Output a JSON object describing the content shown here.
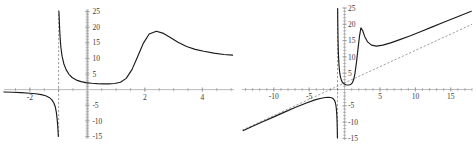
{
  "figure": {
    "panel_count": 2,
    "curve_color": "#1b1b1b",
    "axis_color": "#8d8d8d",
    "asymptote_color": "#5a5a5a",
    "background": "#ffffff"
  },
  "chart_data": [
    {
      "type": "line",
      "title": "",
      "xlabel": "",
      "ylabel": "",
      "grid": false,
      "legend": null,
      "xlim": [
        -2.9,
        5.1
      ],
      "ylim": [
        -15.5,
        25.5
      ],
      "xticks": [
        -2,
        2,
        4
      ],
      "xtick_labels": [
        "-2",
        "2",
        "4"
      ],
      "yticks": [
        -15,
        -10,
        -5,
        5,
        10,
        15,
        20,
        25
      ],
      "ytick_labels": [
        "-15",
        "-10",
        "-5",
        "5",
        "10",
        "15",
        "20",
        "25"
      ],
      "annotations": [
        "vertical asymptote at x = -1 (dashed)"
      ],
      "series": [
        {
          "name": "branch-left",
          "comment": "left branch: flat near y=-1, plunges to -infinity at x=-1",
          "x": [
            -2.9,
            -2.6,
            -2.3,
            -2.0,
            -1.8,
            -1.6,
            -1.45,
            -1.33,
            -1.24,
            -1.17,
            -1.12,
            -1.08,
            -1.05,
            -1.03,
            -1.018,
            -1.01
          ],
          "y": [
            -0.75,
            -0.85,
            -0.98,
            -1.15,
            -1.33,
            -1.62,
            -1.98,
            -2.5,
            -3.2,
            -4.2,
            -5.4,
            -7.2,
            -9.6,
            -11.8,
            -13.6,
            -15.0
          ]
        },
        {
          "name": "branch-right",
          "comment": "right branch: from +infinity at x=-1 down to a shallow valley, rises to peak 18.7 at x=2.4, decays to ~11",
          "x": [
            -0.99,
            -0.98,
            -0.965,
            -0.945,
            -0.92,
            -0.88,
            -0.82,
            -0.74,
            -0.64,
            -0.52,
            -0.38,
            -0.22,
            -0.05,
            0.15,
            0.35,
            0.55,
            0.75,
            0.95,
            1.15,
            1.35,
            1.55,
            1.75,
            1.95,
            2.15,
            2.4,
            2.65,
            2.9,
            3.15,
            3.45,
            3.75,
            4.05,
            4.4,
            4.75,
            5.05
          ],
          "y": [
            25.0,
            23.0,
            19.5,
            16.2,
            13.4,
            10.7,
            8.3,
            6.4,
            4.9,
            3.8,
            3.05,
            2.55,
            2.25,
            2.05,
            1.92,
            1.85,
            1.85,
            1.95,
            2.35,
            3.6,
            6.4,
            10.6,
            14.9,
            17.8,
            18.7,
            18.0,
            16.6,
            15.2,
            13.8,
            12.9,
            12.3,
            11.7,
            11.25,
            11.05
          ]
        }
      ]
    },
    {
      "type": "line",
      "title": "",
      "xlabel": "",
      "ylabel": "",
      "grid": false,
      "legend": null,
      "xlim": [
        -14.5,
        18.0
      ],
      "ylim": [
        -15.5,
        25.0
      ],
      "xticks": [
        -10,
        -5,
        5,
        10,
        15
      ],
      "xtick_labels": [
        "-10",
        "-5",
        "5",
        "10",
        "15"
      ],
      "yticks": [
        -15,
        -10,
        -5,
        5,
        10,
        15,
        20,
        25
      ],
      "ytick_labels": [
        "-15",
        "-10",
        "-5",
        "5",
        "10",
        "15",
        "20",
        "25"
      ],
      "annotations": [
        "vertical asymptote at x = -1 (dashed)",
        "slant asymptote y = x + 2 (dashed)"
      ],
      "series": [
        {
          "name": "branch-left",
          "comment": "lower-left branch hugging the slant asymptote, then falling to -infinity at x=-1",
          "x": [
            -14.3,
            -13.0,
            -11.5,
            -10.0,
            -8.5,
            -7.0,
            -5.5,
            -4.2,
            -3.3,
            -2.7,
            -2.3,
            -2.0,
            -1.78,
            -1.6,
            -1.45,
            -1.33,
            -1.24,
            -1.17,
            -1.11,
            -1.07,
            -1.045,
            -1.028,
            -1.015
          ],
          "y": [
            -12.6,
            -11.3,
            -9.85,
            -8.4,
            -6.95,
            -5.55,
            -4.2,
            -3.2,
            -2.7,
            -2.45,
            -2.4,
            -2.45,
            -2.6,
            -2.85,
            -3.25,
            -3.85,
            -4.7,
            -5.9,
            -7.6,
            -9.6,
            -11.6,
            -13.3,
            -14.9
          ]
        },
        {
          "name": "branch-right",
          "comment": "upper branch: from +infinity at x=-1, dips to a valley near x=0.5, spike to 19 at x=2.3, then rises along y=x+2",
          "x": [
            -0.985,
            -0.975,
            -0.96,
            -0.94,
            -0.91,
            -0.87,
            -0.82,
            -0.76,
            -0.68,
            -0.58,
            -0.46,
            -0.32,
            -0.17,
            0.0,
            0.18,
            0.36,
            0.54,
            0.72,
            0.9,
            1.08,
            1.26,
            1.46,
            1.68,
            1.9,
            2.1,
            2.3,
            2.55,
            2.85,
            3.25,
            3.8,
            4.5,
            5.4,
            6.5,
            7.8,
            9.2,
            10.8,
            12.4,
            14.0,
            15.6,
            17.2,
            17.9
          ],
          "y": [
            24.8,
            22.6,
            19.4,
            16.3,
            13.3,
            10.7,
            8.4,
            6.6,
            5.0,
            3.8,
            2.9,
            2.25,
            1.85,
            1.6,
            1.45,
            1.38,
            1.38,
            1.45,
            1.62,
            2.0,
            2.9,
            4.9,
            8.4,
            12.6,
            16.3,
            18.9,
            18.1,
            16.2,
            14.6,
            13.6,
            13.3,
            13.6,
            14.3,
            15.3,
            16.4,
            17.8,
            19.2,
            20.6,
            22.0,
            23.4,
            24.0
          ]
        }
      ]
    }
  ]
}
